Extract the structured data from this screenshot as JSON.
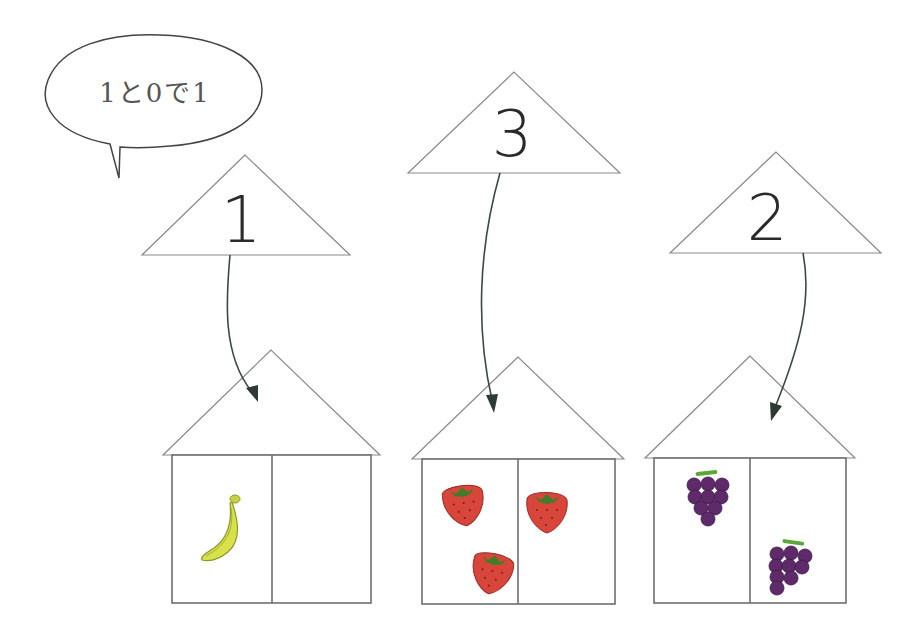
{
  "speech_bubble": {
    "text": "1と0で1"
  },
  "number_triangles": [
    {
      "id": "left",
      "number": "1"
    },
    {
      "id": "middle",
      "number": "3"
    },
    {
      "id": "right",
      "number": "2"
    }
  ],
  "houses": [
    {
      "id": "left",
      "fruit": "banana",
      "left_room_count": 1,
      "right_room_count": 0,
      "total": 1
    },
    {
      "id": "middle",
      "fruit": "strawberry",
      "left_room_count": 2,
      "right_room_count": 1,
      "total": 3
    },
    {
      "id": "right",
      "fruit": "grapes",
      "left_room_count": 1,
      "right_room_count": 1,
      "total": 2
    }
  ],
  "colors": {
    "banana": "#d8e04a",
    "strawberry": "#d8453a",
    "strawberry_leaf": "#3f7d2a",
    "grapes": "#5e2a6a",
    "grape_stem": "#5aa83a",
    "arrow": "#3a4a42",
    "outline": "#8a8a8a"
  }
}
